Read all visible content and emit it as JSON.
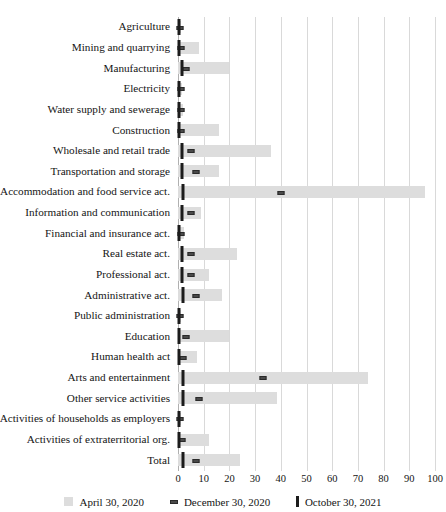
{
  "chart_data": {
    "type": "bar",
    "orientation": "horizontal",
    "title": "",
    "xlabel": "",
    "ylabel": "",
    "xlim": [
      0,
      100
    ],
    "xticks": [
      "0",
      "10",
      "20",
      "30",
      "40",
      "50",
      "60",
      "70",
      "80",
      "90",
      "100"
    ],
    "grid": true,
    "legend_position": "bottom",
    "categories": [
      "Agriculture",
      "Mining and quarrying",
      "Manufacturing",
      "Electricity",
      "Water supply and sewerage",
      "Construction",
      "Wholesale and retail trade",
      "Transportation and storage",
      "Accommodation and food service act.",
      "Information and communication",
      "Financial and insurance act.",
      "Real estate act.",
      "Professional act.",
      "Administrative act.",
      "Public administration",
      "Education",
      "Human health act",
      "Arts and entertainment",
      "Other service activities",
      "Activities of households as employers",
      "Activities of extraterritorial org.",
      "Total"
    ],
    "series": [
      {
        "name": "April 30, 2020",
        "marker": "bar",
        "color": "#dddddd",
        "values": [
          1.0,
          8.0,
          20.0,
          1.5,
          2.0,
          16.0,
          36.0,
          16.0,
          96.0,
          9.0,
          2.5,
          23.0,
          12.0,
          17.0,
          1.0,
          20.0,
          7.5,
          74.0,
          38.5,
          1.0,
          12.0,
          24.0
        ]
      },
      {
        "name": "December 30, 2020",
        "marker": "dash",
        "color": "#4a4a4a",
        "values": [
          0.8,
          1.2,
          3.0,
          1.0,
          1.2,
          1.2,
          5.0,
          7.0,
          40.0,
          5.0,
          1.2,
          5.0,
          5.0,
          7.0,
          0.8,
          3.0,
          2.0,
          33.0,
          8.0,
          0.8,
          1.5,
          7.0
        ]
      },
      {
        "name": "October 30, 2021",
        "marker": "tick",
        "color": "#1c1c1c",
        "values": [
          0.3,
          0.3,
          1.5,
          0.3,
          0.3,
          0.3,
          1.5,
          1.5,
          2.0,
          1.5,
          0.3,
          1.5,
          1.5,
          1.8,
          0.3,
          0.3,
          0.3,
          2.0,
          1.8,
          0.3,
          0.3,
          1.8
        ]
      }
    ]
  }
}
